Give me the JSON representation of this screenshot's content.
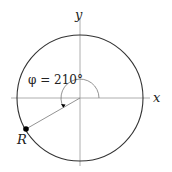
{
  "diagram": {
    "labels": {
      "x_axis": "x",
      "y_axis": "y",
      "angle": "φ = 210°",
      "point": "R"
    },
    "circle": {
      "cx": 80,
      "cy": 98,
      "r": 63
    },
    "angle_deg": 210,
    "colors": {
      "circle": "#333333",
      "axes": "#999999",
      "point": "#000000"
    }
  }
}
